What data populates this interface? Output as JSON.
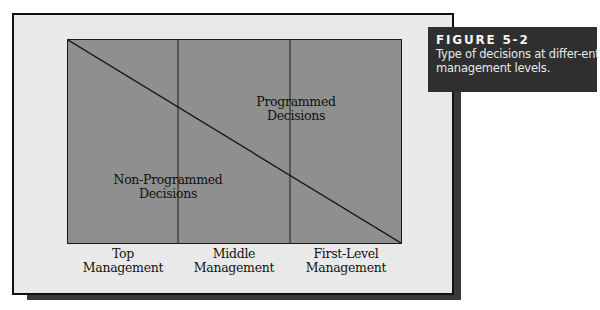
{
  "caption": {
    "title": "FIGURE 5-2",
    "text": "Type of decisions at differ-ent management levels."
  },
  "diagram": {
    "regions": {
      "upper": "Programmed Decisions",
      "upper_line1": "Programmed",
      "upper_line2": "Decisions",
      "lower": "Non-Programmed Decisions",
      "lower_line1": "Non-Programmed",
      "lower_line2": "Decisions"
    },
    "levels": [
      {
        "line1": "Top",
        "line2": "Management"
      },
      {
        "line1": "Middle",
        "line2": "Management"
      },
      {
        "line1": "First-Level",
        "line2": "Management"
      }
    ],
    "colors": {
      "fill": "#8f8f8f",
      "frame": "#e9e9e9",
      "shadow": "#3a3a3a",
      "caption_bg": "#2f2f2f"
    }
  }
}
